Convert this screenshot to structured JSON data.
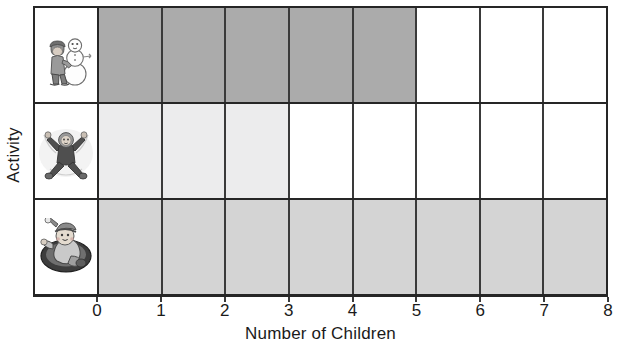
{
  "chart_data": {
    "type": "bar",
    "orientation": "horizontal",
    "title": "",
    "xlabel": "Number of Children",
    "ylabel": "Activity",
    "xlim": [
      0,
      8
    ],
    "xticks": [
      "0",
      "1",
      "2",
      "3",
      "4",
      "5",
      "6",
      "7",
      "8"
    ],
    "grid": true,
    "legend": "none",
    "categories": [
      {
        "icon": "child-building-snowman-icon",
        "description": "Child building a snowman",
        "value": 5,
        "fill": "#ababab"
      },
      {
        "icon": "child-making-snow-angel-icon",
        "description": "Child making a snow angel",
        "value": 3,
        "fill": "#ececed"
      },
      {
        "icon": "child-sledding-icon",
        "description": "Child sledding on a saucer sled",
        "value": 8,
        "fill": "#d4d4d4"
      }
    ],
    "values": [
      5,
      3,
      8
    ],
    "cell_empty_color": "#ffffff",
    "axis_color": "#262626",
    "grid_color": "#3a3a3a"
  }
}
